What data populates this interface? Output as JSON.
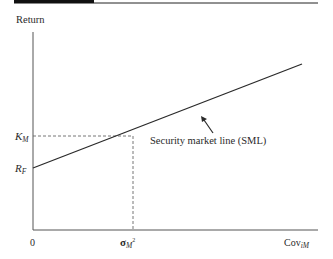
{
  "header": {
    "bar_color": "#111111",
    "rule_color": "#222222"
  },
  "diagram": {
    "title": "",
    "y_axis_label": "Return",
    "x_axis_label_base": "Cov",
    "x_axis_label_sub": "iM",
    "origin_label": "0",
    "x_tick_label_base": "σ",
    "x_tick_label_sub": "M",
    "x_tick_label_sup": "2",
    "y_tick_km_base": "K",
    "y_tick_km_sub": "M",
    "y_tick_rf_base": "R",
    "y_tick_rf_sub": "F",
    "line_label": "Security market line (SML)",
    "line_color": "#2a2a2a",
    "axis_color": "#555555",
    "dash_color": "#666666"
  }
}
